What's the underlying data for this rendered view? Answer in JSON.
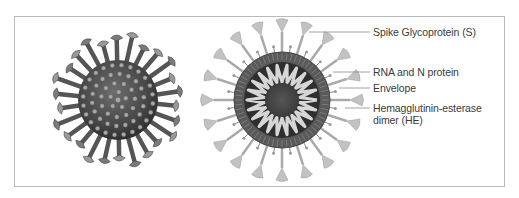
{
  "figure": {
    "views": [
      "exterior-view",
      "cross-section-view"
    ],
    "labels": [
      {
        "id": "spike",
        "text": "Spike Glycoprotein (S)"
      },
      {
        "id": "rna",
        "text": "RNA and N protein"
      },
      {
        "id": "envelope",
        "text": "Envelope"
      },
      {
        "id": "he_line1",
        "text": "Hemagglutinin-esterase"
      },
      {
        "id": "he_line2",
        "text": "dimer (HE)"
      }
    ],
    "colors": {
      "frame": "#b9b9b9",
      "leader": "#8a8a8a",
      "virus_dark": "#3c3c3c",
      "virus_mid": "#6a6a6a",
      "spike_light": "#bdbdbd",
      "rna_coil": "#d9d9d9",
      "core": "#4a4a4a"
    }
  }
}
